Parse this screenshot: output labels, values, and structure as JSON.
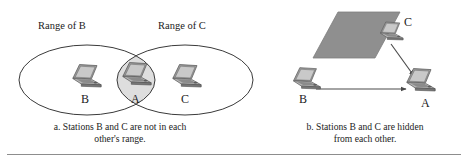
{
  "figure": {
    "background_color": "#ffffff",
    "stroke_color": "#3a3a3a",
    "rule_color": "#8d8d8d"
  },
  "panel_a": {
    "id": "panel-a",
    "range_labels": [
      {
        "name": "range-of-b",
        "text": "Range of B",
        "x": 38,
        "y": 26
      },
      {
        "name": "range-of-c",
        "text": "Range of C",
        "x": 158,
        "y": 26
      }
    ],
    "ellipses": [
      {
        "name": "range-ellipse-b",
        "cx": 87,
        "cy": 80,
        "rx": 68,
        "ry": 35
      },
      {
        "name": "range-ellipse-c",
        "cx": 185,
        "cy": 80,
        "rx": 68,
        "ry": 35
      }
    ],
    "overlap_region": {
      "name": "overlap-lens",
      "fill": "#dedede",
      "cx": 136,
      "cy": 80,
      "rx": 19,
      "ry": 27
    },
    "stations": [
      {
        "name": "station-b",
        "label": "B",
        "x": 86,
        "y": 84,
        "label_x": 81,
        "label_y": 100
      },
      {
        "name": "station-a",
        "label": "A",
        "x": 136,
        "y": 82,
        "label_x": 131,
        "label_y": 100
      },
      {
        "name": "station-c",
        "label": "C",
        "x": 186,
        "y": 84,
        "label_x": 181,
        "label_y": 100
      }
    ],
    "caption": {
      "name": "caption-a",
      "line1": "a. Stations B and C are not in each",
      "line2": "other's range.",
      "x": 45,
      "y": 122,
      "width": 150
    }
  },
  "panel_b": {
    "id": "panel-b",
    "obstacle": {
      "name": "wall-obstacle",
      "fill": "#8f8f8f",
      "points": "313,58 338,12 400,12 375,58"
    },
    "stations": [
      {
        "name": "station-b",
        "label": "B",
        "x": 306,
        "y": 84,
        "label_x": 299,
        "label_y": 100
      },
      {
        "name": "station-c",
        "label": "C",
        "x": 390,
        "y": 34,
        "label_x": 403,
        "label_y": 23
      },
      {
        "name": "station-a",
        "label": "A",
        "x": 418,
        "y": 87,
        "label_x": 421,
        "label_y": 104
      }
    ],
    "arrows": [
      {
        "name": "arrow-b-to-a",
        "x1": 314,
        "y1": 89,
        "x2": 408,
        "y2": 89
      },
      {
        "name": "arrow-c-to-a",
        "x1": 392,
        "y1": 43,
        "x2": 418,
        "y2": 78
      }
    ],
    "caption": {
      "name": "caption-b",
      "line1": "b. Stations B and C are hidden",
      "line2": "from each other.",
      "x": 290,
      "y": 122,
      "width": 150
    }
  },
  "bottom_rule": {
    "name": "bottom-divider",
    "present": true
  }
}
